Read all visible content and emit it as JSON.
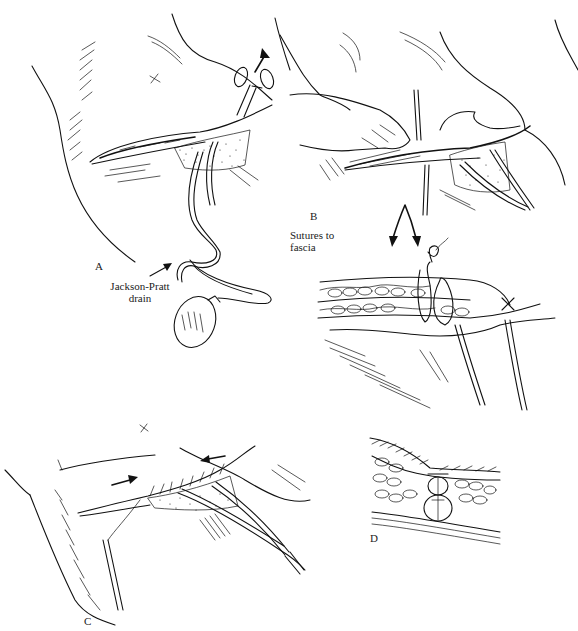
{
  "figure": {
    "panels": [
      {
        "id": "A",
        "label": "A"
      },
      {
        "id": "B",
        "label": "B"
      },
      {
        "id": "C",
        "label": "C"
      },
      {
        "id": "D",
        "label": "D"
      }
    ],
    "annotations": {
      "drain_line1": "Jackson-Pratt",
      "drain_line2": "drain",
      "sutures_line1": "Sutures to",
      "sutures_line2": "fascia"
    },
    "marks": {
      "skin_mark": "x"
    },
    "colors": {
      "ink": "#111111",
      "paper": "#ffffff"
    }
  }
}
